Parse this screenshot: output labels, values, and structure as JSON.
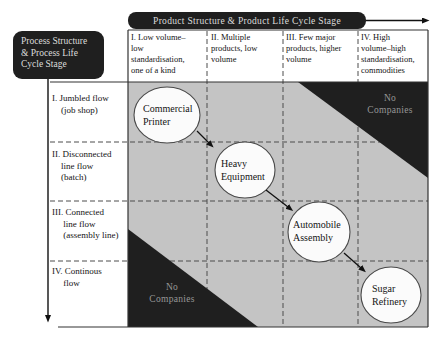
{
  "title_banners": {
    "top": "Product Structure & Product Life Cycle Stage",
    "left": "Process Structure\n& Process Life\nCycle Stage"
  },
  "columns": [
    {
      "label": "I. Low volume–\nlow\nstandardisation,\none of a kind"
    },
    {
      "label": "II. Multiple\nproducts, low\nvolume"
    },
    {
      "label": "III. Few major\nproducts, higher\nvolume"
    },
    {
      "label": "IV. High\nvolume–high\nstandardisation,\ncommodities"
    }
  ],
  "rows": [
    {
      "label": "I. Jumbled flow\n    (job shop)"
    },
    {
      "label": "II. Disconnected\n    line flow\n    (batch)"
    },
    {
      "label": "III. Connected\n     line flow\n     (assembly line)"
    },
    {
      "label": "IV. Continous\n     flow"
    }
  ],
  "bubbles": [
    {
      "label": "Commercial\nPrinter",
      "row": "I",
      "column": "I"
    },
    {
      "label": "Heavy\nEquipment",
      "row": "II",
      "column": "II"
    },
    {
      "label": "Automobile\nAssembly",
      "row": "III",
      "column": "III"
    },
    {
      "label": "Sugar\nRefinery",
      "row": "IV",
      "column": "IV"
    }
  ],
  "no_companies_regions": [
    {
      "position": "top-right",
      "label": "No\nCompanies"
    },
    {
      "position": "bottom-left",
      "label": "No\nCompanies"
    }
  ],
  "colors": {
    "dark_fill": "#1f1f1f",
    "matrix_fill": "#c4c4c4",
    "banner_text": "#dcdcdc",
    "region_text": "#979797",
    "line": "#333333"
  }
}
